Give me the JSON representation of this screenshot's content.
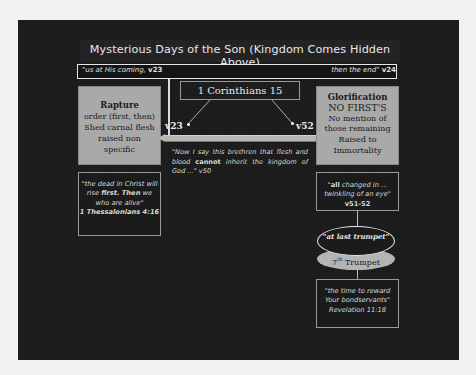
{
  "slide": {
    "title": "Mysterious Days of the Son (Kingdom Comes Hidden Above)",
    "timeline": {
      "left_quote": "\"us at His coming, ",
      "left_ref": "v23",
      "right_quote": "then the end\" ",
      "right_ref": "v24"
    },
    "center_label": "1 Corinthians 15",
    "verse_labels": {
      "left": "v23",
      "right": "v52"
    },
    "rapture_box": {
      "heading": "Rapture",
      "lines": [
        "order (first, then)",
        "Shed carnal flesh",
        "raised non",
        "specific"
      ]
    },
    "glorification_box": {
      "heading": "Glorification",
      "subheading": "NO FIRST'S",
      "lines": [
        "No mention of",
        "those remaining",
        "Raised to",
        "Immortality"
      ]
    },
    "center_quote": {
      "part1": "\"Now I say this brethren that flesh and blood ",
      "bold": "cannot",
      "part2": " inherit the kingdom of God ...\" v50"
    },
    "thessalonians_box": {
      "part1": "\"the dead in Christ will rise ",
      "bold1": "first. Then",
      "part2": " we who are alive\"",
      "ref": "1 Thessalonians 4:16"
    },
    "all_changed_box": {
      "open": "\"",
      "bold": "all",
      "text": " changed in ... twinkling of an eye\" ",
      "ref": "v51-52"
    },
    "last_trumpet_oval": "\"at last trumpet\"",
    "seventh_trumpet_oval": {
      "num": "7",
      "sup": "th",
      "text": " Trumpet"
    },
    "revelation_box": {
      "quote": "\"the time to reward Your bondservants\"",
      "ref": "Revelation 11:18"
    }
  }
}
